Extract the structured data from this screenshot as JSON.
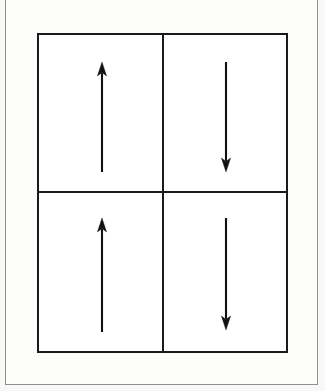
{
  "figure": {
    "title": "Four-panel arrow direction diagram",
    "background_color": "#f8f8f6",
    "page_frame_color": "#8e8e8e",
    "ink_color": "#111111",
    "box_color": "#1a1a1a",
    "panel_fill": "#ffffff",
    "layout": {
      "rows": 2,
      "columns": 2,
      "box_left": 37,
      "box_top": 33,
      "box_width": 251,
      "box_height": 320,
      "divider_x": 125,
      "divider_y": 158
    },
    "panels": [
      {
        "id": "top-left",
        "row": 1,
        "column": 1,
        "arrow_direction": "up",
        "arrow_label": "up-arrow",
        "arrow_x": 63,
        "arrow_tip_y": 29,
        "arrow_tail_y": 137,
        "arrow_length": 108
      },
      {
        "id": "top-right",
        "row": 1,
        "column": 2,
        "arrow_direction": "down",
        "arrow_label": "down-arrow",
        "arrow_x": 62,
        "arrow_tip_y": 137,
        "arrow_tail_y": 29,
        "arrow_length": 108
      },
      {
        "id": "bottom-left",
        "row": 2,
        "column": 1,
        "arrow_direction": "up",
        "arrow_label": "up-arrow",
        "arrow_x": 63,
        "arrow_tip_y": 27,
        "arrow_tail_y": 139,
        "arrow_length": 112
      },
      {
        "id": "bottom-right",
        "row": 2,
        "column": 2,
        "arrow_direction": "down",
        "arrow_label": "down-arrow",
        "arrow_x": 62,
        "arrow_tip_y": 137,
        "arrow_tail_y": 27,
        "arrow_length": 110
      }
    ]
  }
}
